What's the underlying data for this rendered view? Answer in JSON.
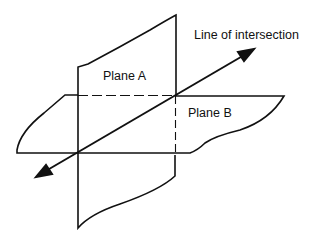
{
  "diagram": {
    "type": "intersecting-planes",
    "labels": {
      "plane_a": "Plane A",
      "plane_b": "Plane B",
      "line": "Line of intersection"
    },
    "colors": {
      "stroke": "#111111",
      "background": "#ffffff"
    }
  }
}
